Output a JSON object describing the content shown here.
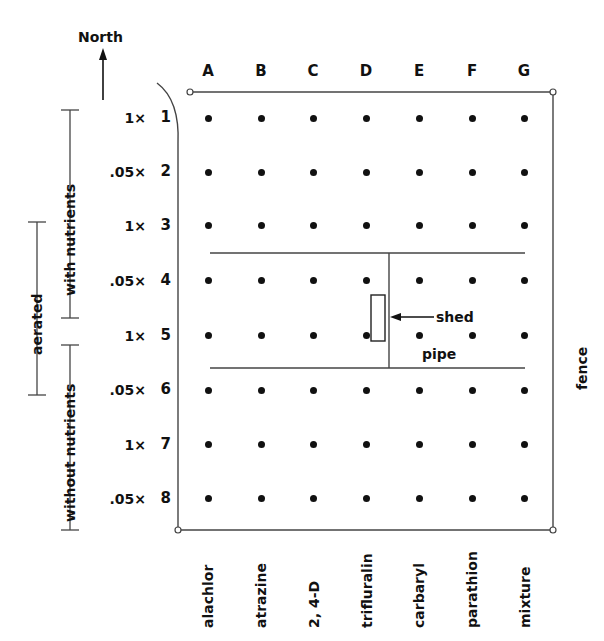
{
  "figure": {
    "type": "plot-layout-diagram",
    "orientation_label": "North",
    "boundary_label": "fence",
    "features": [
      {
        "name": "shed",
        "label": "shed"
      },
      {
        "name": "pipe",
        "label": "pipe"
      }
    ]
  },
  "columns": {
    "letters": [
      "A",
      "B",
      "C",
      "D",
      "E",
      "F",
      "G"
    ],
    "treatments": [
      "alachlor",
      "atrazine",
      "2, 4-D",
      "trifluralin",
      "carbaryl",
      "parathion",
      "mixture"
    ]
  },
  "rows": {
    "numbers": [
      "1",
      "2",
      "3",
      "4",
      "5",
      "6",
      "7",
      "8"
    ],
    "doses": [
      "1×",
      ".05×",
      "1×",
      ".05×",
      "1×",
      ".05×",
      "1×",
      ".05×"
    ]
  },
  "brackets": {
    "aerated": "aerated",
    "with_nutrients": "with nutrients",
    "without_nutrients": "without nutrients"
  },
  "colors": {
    "ink": "#111111",
    "background": "#ffffff",
    "line": "#333333"
  },
  "chart_data": {
    "type": "table",
    "title": "",
    "xlabel": "",
    "ylabel": "",
    "categories": [
      "A",
      "B",
      "C",
      "D",
      "E",
      "F",
      "G"
    ],
    "row_labels": [
      "1",
      "2",
      "3",
      "4",
      "5",
      "6",
      "7",
      "8"
    ],
    "grid": true,
    "legend": "none",
    "plot_points": 56,
    "cells": [
      {
        "row": "1",
        "dose": "1×",
        "nutrients": "with nutrients",
        "aerated": true,
        "plots": [
          "A1",
          "B1",
          "C1",
          "D1",
          "E1",
          "F1",
          "G1"
        ]
      },
      {
        "row": "2",
        "dose": ".05×",
        "nutrients": "with nutrients",
        "aerated": true,
        "plots": [
          "A2",
          "B2",
          "C2",
          "D2",
          "E2",
          "F2",
          "G2"
        ]
      },
      {
        "row": "3",
        "dose": "1×",
        "nutrients": "with nutrients",
        "aerated": true,
        "plots": [
          "A3",
          "B3",
          "C3",
          "D3",
          "E3",
          "F3",
          "G3"
        ]
      },
      {
        "row": "4",
        "dose": ".05×",
        "nutrients": "with nutrients",
        "aerated": true,
        "plots": [
          "A4",
          "B4",
          "C4",
          "D4",
          "E4",
          "F4",
          "G4"
        ]
      },
      {
        "row": "5",
        "dose": "1×",
        "nutrients": "without nutrients",
        "aerated": true,
        "plots": [
          "A5",
          "B5",
          "C5",
          "D5",
          "E5",
          "F5",
          "G5"
        ]
      },
      {
        "row": "6",
        "dose": ".05×",
        "nutrients": "without nutrients",
        "aerated": true,
        "plots": [
          "A6",
          "B6",
          "C6",
          "D6",
          "E6",
          "F6",
          "G6"
        ]
      },
      {
        "row": "7",
        "dose": "1×",
        "nutrients": "without nutrients",
        "aerated": false,
        "plots": [
          "A7",
          "B7",
          "C7",
          "D7",
          "E7",
          "F7",
          "G7"
        ]
      },
      {
        "row": "8",
        "dose": ".05×",
        "nutrients": "without nutrients",
        "aerated": false,
        "plots": [
          "A8",
          "B8",
          "C8",
          "D8",
          "E8",
          "F8",
          "G8"
        ]
      }
    ],
    "annotations": [
      "North",
      "fence",
      "shed",
      "pipe",
      "aerated",
      "with nutrients",
      "without nutrients"
    ]
  }
}
